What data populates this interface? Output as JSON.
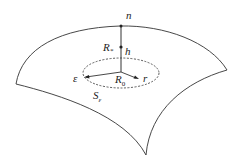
{
  "diagram": {
    "labels": {
      "normal": "n",
      "point_star": "R",
      "point_star_sub": "*",
      "height": "h",
      "epsilon": "ε",
      "origin": "R",
      "origin_sub": "0",
      "radius": "r",
      "surface": "S",
      "surface_sub": "ε"
    },
    "colors": {
      "stroke": "#333333",
      "background": "#ffffff"
    }
  }
}
